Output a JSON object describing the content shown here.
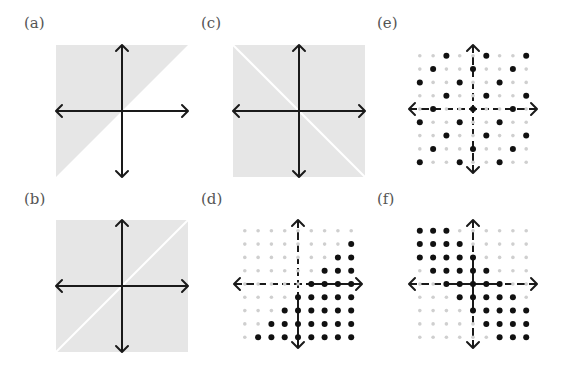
{
  "figure": {
    "colors": {
      "shade": "#e6e6e6",
      "axis": "#1a1a1a",
      "point_in": "#111111",
      "point_out": "#cfcfcf",
      "gap_line": "#ffffff"
    },
    "panels": [
      {
        "id": "a",
        "label": "(a)",
        "type": "continuous",
        "region": "half-plane above y = x (y >= x)",
        "label_pos": [
          24,
          16
        ],
        "center": [
          122,
          111
        ],
        "half": 66
      },
      {
        "id": "b",
        "label": "(b)",
        "type": "continuous",
        "region": "plane minus the line y = x",
        "label_pos": [
          24,
          192
        ],
        "center": [
          122,
          286
        ],
        "half": 66
      },
      {
        "id": "c",
        "label": "(c)",
        "type": "continuous",
        "region": "plane minus the line y = -x",
        "label_pos": [
          201,
          16
        ],
        "center": [
          299,
          111
        ],
        "half": 66
      },
      {
        "id": "d",
        "label": "(d)",
        "type": "lattice",
        "rule": "y < x",
        "label_pos": [
          201,
          192
        ],
        "center": [
          298,
          284
        ],
        "spacing": 13.3
      },
      {
        "id": "e",
        "label": "(e)",
        "type": "lattice",
        "rule": "x ≡ y (mod 3)",
        "label_pos": [
          377,
          16
        ],
        "center": [
          473,
          109
        ],
        "spacing": 13.3
      },
      {
        "id": "f",
        "label": "(f)",
        "type": "lattice",
        "rule": "|x + y| <= 2",
        "label_pos": [
          377,
          192
        ],
        "center": [
          473,
          284
        ],
        "spacing": 13.3
      }
    ],
    "lattice_range": [
      -4,
      4
    ]
  }
}
